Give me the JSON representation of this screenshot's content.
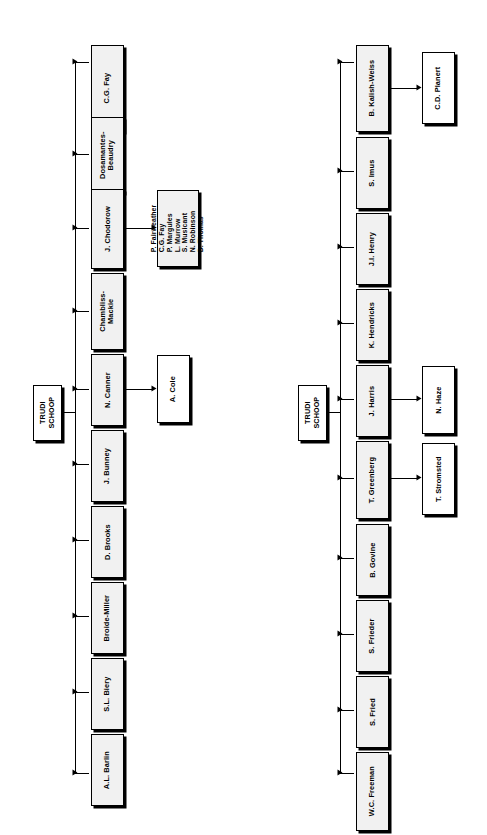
{
  "figure": {
    "type": "organizational-chart",
    "orientation": "rotated-90-ccw",
    "background_color": "#ffffff",
    "box_fill_color": "#f1f1f1",
    "line_color": "#000000"
  },
  "charts": [
    {
      "id": "chart-upper",
      "root": {
        "label": "TRUDI\nSCHOOP"
      },
      "children": [
        {
          "label": "C.G. Fay"
        },
        {
          "label": "Dosamantes-\nBeaudry"
        },
        {
          "label": "J. Chodorow",
          "child": {
            "label": "P. Fairweather\nC.G. Fay\nP. Margules\nL. Murrow\nS. Musicant\nN. Robinson\nD. Thomas"
          }
        },
        {
          "label": "Chambliss-\nMackie"
        },
        {
          "label": "N. Canner",
          "child": {
            "label": "A. Cole"
          }
        },
        {
          "label": "J. Bunney"
        },
        {
          "label": "D. Brooks"
        },
        {
          "label": "Broide-Miller"
        },
        {
          "label": "S.L. Biery"
        },
        {
          "label": "A.L. Barlin"
        }
      ]
    },
    {
      "id": "chart-lower",
      "root": {
        "label": "TRUDI\nSCHOOP"
      },
      "children": [
        {
          "label": "B. Kalish-Weiss",
          "child": {
            "label": "C.D. Planert"
          }
        },
        {
          "label": "S. Imus"
        },
        {
          "label": "J.I. Henry"
        },
        {
          "label": "K. Hendricks"
        },
        {
          "label": "J. Harris",
          "child": {
            "label": "N. Haze"
          }
        },
        {
          "label": "T. Greenberg",
          "child": {
            "label": "T. Stromsted"
          }
        },
        {
          "label": "B. Govine"
        },
        {
          "label": "S. Frieder"
        },
        {
          "label": "S. Fried"
        },
        {
          "label": "W.C. Freeman"
        }
      ]
    }
  ]
}
